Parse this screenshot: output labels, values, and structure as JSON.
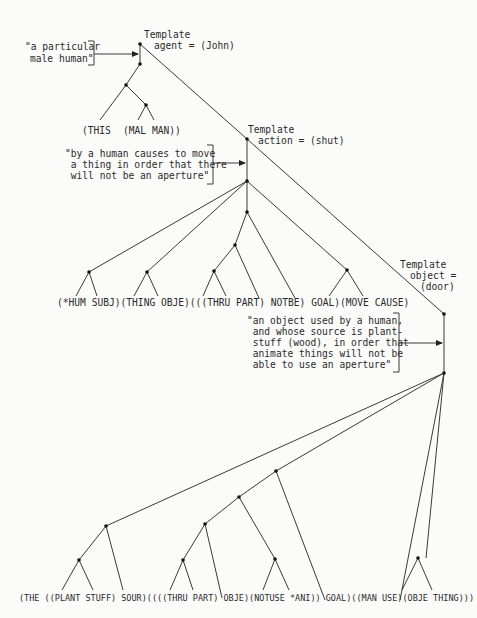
{
  "templates": {
    "agent": {
      "line1": "Template",
      "line2": "agent = (John)"
    },
    "action": {
      "line1": "Template",
      "line2": "action = (shut)"
    },
    "object": {
      "line1": "Template",
      "line2": "object =",
      "line3": "(door)"
    }
  },
  "glosses": {
    "agent": [
      "\"a particular",
      "male human\""
    ],
    "action": [
      "\"by a human causes to move",
      " a thing in order that there",
      " will not be an aperture\""
    ],
    "object": [
      "\"an object used by a human,",
      " and whose source is plant-",
      " stuff (wood), in order that",
      " animate things will not be",
      " able to use an aperture\""
    ]
  },
  "formulas": {
    "agent": [
      "(THIS",
      "(MAL MAN))"
    ],
    "action": "(*HUM SUBJ)(THING OBJE)(((THRU PART) NOTBE) GOAL)(MOVE CAUSE)",
    "object": "(THE ((PLANT STUFF) SOUR)((((THRU PART) OBJE)(NOTUSE *ANI)) GOAL)((MAN USE)(OBJE THING)))"
  }
}
